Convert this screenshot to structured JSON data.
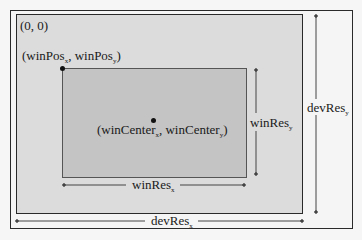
{
  "diagram": {
    "origin_label": "(0, 0)",
    "win_pos": {
      "open": "(winPos",
      "x_sub": "x",
      "mid": ", winPos",
      "y_sub": "y",
      "close": ")"
    },
    "win_center": {
      "open": "(winCenter",
      "x_sub": "x",
      "mid": ", winCenter",
      "y_sub": "y",
      "close": ")"
    },
    "win_res_x": {
      "base": "winRes",
      "sub": "x"
    },
    "win_res_y": {
      "base": "winRes",
      "sub": "y"
    },
    "dev_res_x": {
      "base": "devRes",
      "sub": "x"
    },
    "dev_res_y": {
      "base": "devRes",
      "sub": "y"
    }
  },
  "colors": {
    "background": "#f5f5f5",
    "device": "#dcdcdc",
    "window": "#c4c4c4",
    "stroke": "#2a2a2a"
  }
}
